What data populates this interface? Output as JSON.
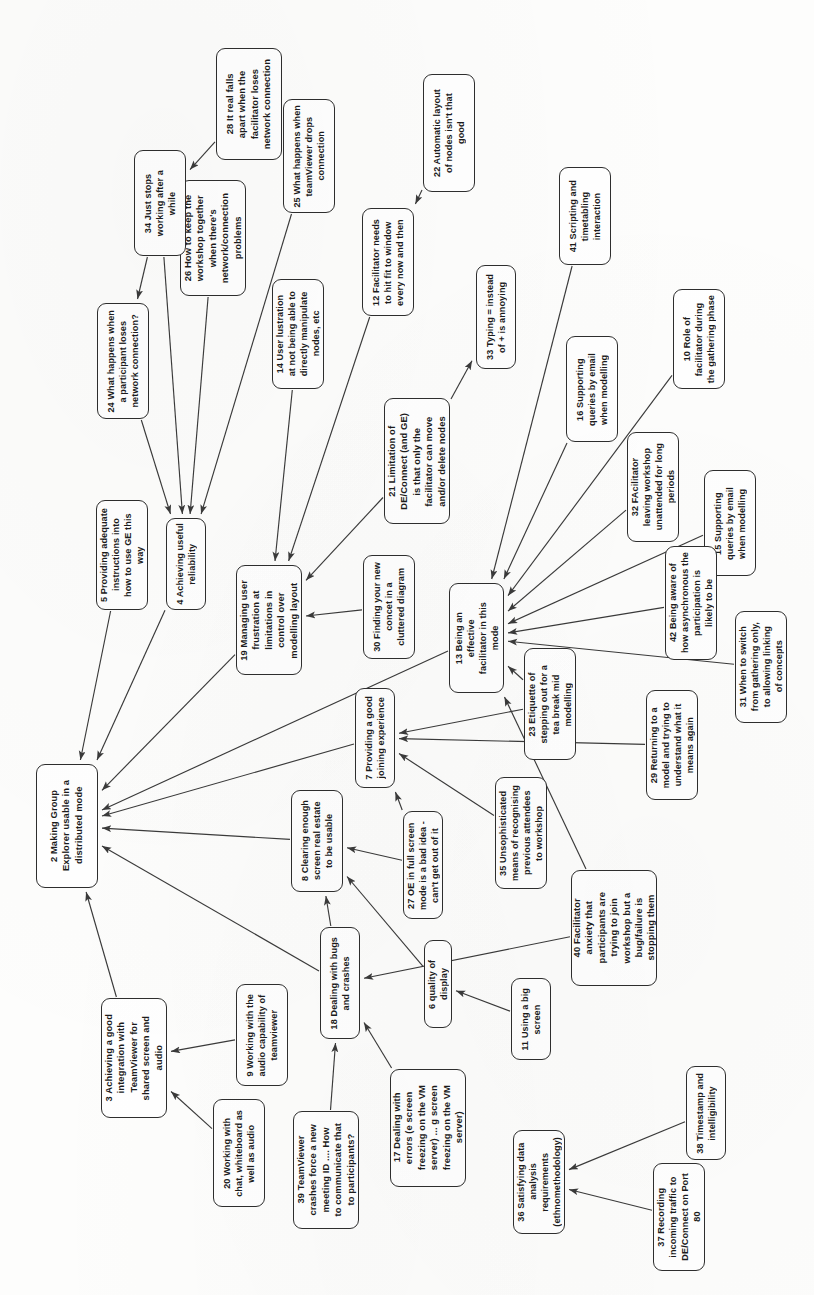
{
  "diagram": {
    "orientation": "rotated-90-ccw",
    "node_fill": "#ffffff",
    "node_stroke": "#2e2e2e",
    "edge_stroke": "#3a3a3a",
    "background": "#fdfdfc"
  },
  "chart_data": {
    "type": "diagram",
    "title": "Making Group Explorer usable in a distributed mode",
    "nodes": [
      {
        "id": "2",
        "label": "2 Making Group\nExplorer usable in a\ndistributed mode"
      },
      {
        "id": "3",
        "label": "3 Achieving a good\nintegration with\nTeamViewer for\nshared screen and\naudio"
      },
      {
        "id": "4",
        "label": "4 Achieving useful\nreliability"
      },
      {
        "id": "5",
        "label": "5 Providing adequate\ninstructions into\nhow to use GE this\nway"
      },
      {
        "id": "6",
        "label": "6 quality of display"
      },
      {
        "id": "7",
        "label": "7 Providing a good\njoining experience"
      },
      {
        "id": "8",
        "label": "8 Clearing enough\nscreen real estate\nto be usable"
      },
      {
        "id": "9",
        "label": "9 Working with the\naudio capability of\nteamviewer"
      },
      {
        "id": "10",
        "label": "10 Role of\nfacilitator during\nthe gathering phase"
      },
      {
        "id": "11",
        "label": "11 Using a big\nscreen"
      },
      {
        "id": "12",
        "label": "12 Facilitator needs\nto hit fit to window\nevery now and then"
      },
      {
        "id": "13",
        "label": "13 Being an\neffective\nfacilitator in this\nmode"
      },
      {
        "id": "14",
        "label": "14 User lustration\nat not being able to\ndirectly manipulate\nnodes, etc"
      },
      {
        "id": "15",
        "label": "15 Supporting\nqueries by email\nwhen modelling"
      },
      {
        "id": "16",
        "label": "16 Supporting\nqueries by email\nwhen modelling"
      },
      {
        "id": "17",
        "label": "17 Dealing with\nerrors (e screen\nfreezing on the VM\nserver) ... g screen\nfreezing on the VM\nserver)"
      },
      {
        "id": "18",
        "label": "18 Dealing with bugs\nand crashes"
      },
      {
        "id": "19",
        "label": "19 Managing user\nfrustration at\nlimitations in\ncontrol over\nmodelling layout"
      },
      {
        "id": "20",
        "label": "20 Working with\nchat, whiteboard as\nwell as audio"
      },
      {
        "id": "21",
        "label": "21 Limitation of\nDE/Connect (and GE)\nis that only the\nfacilitator can move\nand/or delete nodes"
      },
      {
        "id": "22",
        "label": "22 Automatic layout\nof nodes isn't that\ngood"
      },
      {
        "id": "23",
        "label": "23 Etiquette of\nstepping out for a\ntea break mid\nmodelling"
      },
      {
        "id": "24",
        "label": "24 What happens when\na participant loses\nnetwork connection?"
      },
      {
        "id": "25",
        "label": "25 What happens when\nteamViewer drops\nconnection"
      },
      {
        "id": "26",
        "label": "26 How to keep the\nworkshop together\nwhen there's\nnetwork/connection\nproblems"
      },
      {
        "id": "27",
        "label": "27 OE in full screen\nmode is a bad idea -\ncan't get out of it"
      },
      {
        "id": "28",
        "label": "28 It real falls\napart when the\nfacilitator loses\nnetwork connection"
      },
      {
        "id": "29",
        "label": "29 Returning to a\nmodel and trying to\nunderstand what it\nmeans again"
      },
      {
        "id": "30",
        "label": "30 Finding your new\nconcet in a\ncluttered diagram"
      },
      {
        "id": "31",
        "label": "31 When to switch\nfrom gathering only,\nto allowing linking\nof concepts"
      },
      {
        "id": "32",
        "label": "32 FAcilitator\nleaving workshop\nunattended for long\nperiods"
      },
      {
        "id": "33",
        "label": "33 Typing = instead\nof + is annoying"
      },
      {
        "id": "34",
        "label": "34 Just stops\nworking after a\nwhile"
      },
      {
        "id": "35",
        "label": "35 Unsophisticated\nmeans of recognising\nprevious attendees\nto workshop"
      },
      {
        "id": "36",
        "label": "36 Satisfying data\nanalysis\nrequirements\n(ethnomethodology)"
      },
      {
        "id": "37",
        "label": "37 Recording\nincoming traffic to\nDE/Connect on Port\n80"
      },
      {
        "id": "38",
        "label": "38 Timestamp and\nintelligibility"
      },
      {
        "id": "39",
        "label": "39 TeamViewer\ncrashes force a new\nmeeting ID .... How\nto communicate that\nto participants?"
      },
      {
        "id": "40",
        "label": "40 Facilitator\nanxiety that\nparticipants are\ntrying to join\nworkshop but a\nbug/failure is\nstopping them"
      },
      {
        "id": "41",
        "label": "41 Scripting and\ntimetabling\ninteraction"
      },
      {
        "id": "42",
        "label": "42 Being aware of\nhow asynchronous the\nparticipation is\nlikely to be"
      }
    ],
    "edges": [
      {
        "from": "28",
        "to": "34"
      },
      {
        "from": "34",
        "to": "24"
      },
      {
        "from": "34",
        "to": "4"
      },
      {
        "from": "24",
        "to": "4"
      },
      {
        "from": "26",
        "to": "4"
      },
      {
        "from": "25",
        "to": "4"
      },
      {
        "from": "4",
        "to": "2"
      },
      {
        "from": "5",
        "to": "2"
      },
      {
        "from": "19",
        "to": "2"
      },
      {
        "from": "13",
        "to": "2"
      },
      {
        "from": "7",
        "to": "2"
      },
      {
        "from": "8",
        "to": "2"
      },
      {
        "from": "18",
        "to": "2"
      },
      {
        "from": "3",
        "to": "2"
      },
      {
        "from": "14",
        "to": "19"
      },
      {
        "from": "12",
        "to": "19"
      },
      {
        "from": "21",
        "to": "19"
      },
      {
        "from": "30",
        "to": "19"
      },
      {
        "from": "22",
        "to": "12"
      },
      {
        "from": "21",
        "to": "33"
      },
      {
        "from": "41",
        "to": "13"
      },
      {
        "from": "16",
        "to": "13"
      },
      {
        "from": "10",
        "to": "13"
      },
      {
        "from": "32",
        "to": "13"
      },
      {
        "from": "15",
        "to": "13"
      },
      {
        "from": "42",
        "to": "13"
      },
      {
        "from": "31",
        "to": "13"
      },
      {
        "from": "23",
        "to": "13"
      },
      {
        "from": "40",
        "to": "13"
      },
      {
        "from": "23",
        "to": "7"
      },
      {
        "from": "29",
        "to": "7"
      },
      {
        "from": "35",
        "to": "7"
      },
      {
        "from": "27",
        "to": "7"
      },
      {
        "from": "27",
        "to": "8"
      },
      {
        "from": "6",
        "to": "8"
      },
      {
        "from": "18",
        "to": "8"
      },
      {
        "from": "40",
        "to": "18"
      },
      {
        "from": "39",
        "to": "18"
      },
      {
        "from": "17",
        "to": "18"
      },
      {
        "from": "9",
        "to": "3"
      },
      {
        "from": "20",
        "to": "3"
      },
      {
        "from": "11",
        "to": "6"
      },
      {
        "from": "38",
        "to": "36"
      },
      {
        "from": "37",
        "to": "36"
      }
    ]
  },
  "layout": {
    "nodes": {
      "2": {
        "x": 36,
        "y": 764,
        "w": 62,
        "h": 124
      },
      "3": {
        "x": 101,
        "y": 998,
        "w": 66,
        "h": 120
      },
      "4": {
        "x": 166,
        "y": 518,
        "w": 40,
        "h": 92
      },
      "5": {
        "x": 96,
        "y": 500,
        "w": 52,
        "h": 110
      },
      "6": {
        "x": 424,
        "y": 940,
        "w": 28,
        "h": 88
      },
      "7": {
        "x": 355,
        "y": 688,
        "w": 40,
        "h": 100
      },
      "8": {
        "x": 291,
        "y": 790,
        "w": 52,
        "h": 102
      },
      "9": {
        "x": 236,
        "y": 984,
        "w": 52,
        "h": 102
      },
      "10": {
        "x": 673,
        "y": 289,
        "w": 52,
        "h": 100
      },
      "11": {
        "x": 511,
        "y": 978,
        "w": 40,
        "h": 82
      },
      "12": {
        "x": 362,
        "y": 208,
        "w": 52,
        "h": 108
      },
      "13": {
        "x": 449,
        "y": 583,
        "w": 55,
        "h": 110
      },
      "14": {
        "x": 272,
        "y": 279,
        "w": 52,
        "h": 110
      },
      "15": {
        "x": 704,
        "y": 470,
        "w": 52,
        "h": 106
      },
      "16": {
        "x": 566,
        "y": 336,
        "w": 52,
        "h": 106
      },
      "17": {
        "x": 390,
        "y": 1069,
        "w": 76,
        "h": 118
      },
      "18": {
        "x": 320,
        "y": 927,
        "w": 40,
        "h": 112
      },
      "19": {
        "x": 236,
        "y": 565,
        "w": 66,
        "h": 110
      },
      "20": {
        "x": 213,
        "y": 1099,
        "w": 52,
        "h": 108
      },
      "21": {
        "x": 384,
        "y": 398,
        "w": 66,
        "h": 126
      },
      "22": {
        "x": 423,
        "y": 74,
        "w": 52,
        "h": 118
      },
      "23": {
        "x": 524,
        "y": 648,
        "w": 52,
        "h": 112
      },
      "24": {
        "x": 97,
        "y": 303,
        "w": 52,
        "h": 116
      },
      "25": {
        "x": 283,
        "y": 99,
        "w": 52,
        "h": 114
      },
      "26": {
        "x": 180,
        "y": 180,
        "w": 66,
        "h": 116
      },
      "27": {
        "x": 403,
        "y": 811,
        "w": 40,
        "h": 108
      },
      "28": {
        "x": 216,
        "y": 48,
        "w": 66,
        "h": 112
      },
      "29": {
        "x": 646,
        "y": 690,
        "w": 52,
        "h": 110
      },
      "30": {
        "x": 363,
        "y": 555,
        "w": 52,
        "h": 104
      },
      "31": {
        "x": 735,
        "y": 611,
        "w": 52,
        "h": 112
      },
      "32": {
        "x": 627,
        "y": 432,
        "w": 52,
        "h": 110
      },
      "33": {
        "x": 476,
        "y": 265,
        "w": 40,
        "h": 104
      },
      "34": {
        "x": 134,
        "y": 150,
        "w": 52,
        "h": 106
      },
      "35": {
        "x": 495,
        "y": 777,
        "w": 52,
        "h": 112
      },
      "36": {
        "x": 513,
        "y": 1130,
        "w": 52,
        "h": 104
      },
      "37": {
        "x": 653,
        "y": 1163,
        "w": 52,
        "h": 108
      },
      "38": {
        "x": 686,
        "y": 1066,
        "w": 40,
        "h": 94
      },
      "39": {
        "x": 293,
        "y": 1111,
        "w": 66,
        "h": 118
      },
      "40": {
        "x": 571,
        "y": 870,
        "w": 86,
        "h": 116
      },
      "41": {
        "x": 559,
        "y": 167,
        "w": 52,
        "h": 98
      },
      "42": {
        "x": 665,
        "y": 546,
        "w": 52,
        "h": 114
      }
    }
  }
}
